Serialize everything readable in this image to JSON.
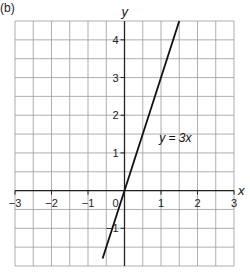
{
  "panel_label": "(b)",
  "chart_data": {
    "type": "line",
    "title": "",
    "xlabel": "x",
    "ylabel": "y",
    "xlim": [
      -3,
      3
    ],
    "ylim": [
      -2,
      4.5
    ],
    "grid": true,
    "grid_step": 0.5,
    "x_ticks": [
      -3,
      -2,
      -1,
      0,
      1,
      2,
      3
    ],
    "x_tick_labels": [
      "−3",
      "−2",
      "−1",
      "0",
      "1",
      "2",
      "3"
    ],
    "y_ticks": [
      -1,
      1,
      2,
      3,
      4
    ],
    "y_tick_labels": [
      "−1",
      "1",
      "2",
      "3",
      "4"
    ],
    "series": [
      {
        "name": "y = 3x",
        "equation": "y = 3x",
        "x": [
          -0.6,
          1.5
        ],
        "y": [
          -1.8,
          4.5
        ],
        "color": "#111111"
      }
    ],
    "annotations": [
      {
        "text": "y = 3x",
        "x": 0.95,
        "y": 1.3
      }
    ],
    "colors": {
      "grid": "#9a9a9a",
      "axis": "#222222",
      "line": "#111111"
    }
  }
}
